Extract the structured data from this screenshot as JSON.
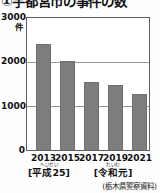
{
  "chart_data": {
    "type": "bar",
    "title": "①宇都宮市の事件の数",
    "xlabel": "",
    "ylabel": "件",
    "ylim": [
      0,
      3000
    ],
    "grid": true,
    "legend": null,
    "categories": [
      "2013",
      "2015",
      "2017",
      "2019",
      "2021"
    ],
    "values": [
      2400,
      2030,
      1550,
      1470,
      1280
    ],
    "ytick_labels": [
      "3000",
      "2000",
      "1000",
      "0"
    ],
    "ytick_values": [
      3000,
      2000,
      1000,
      0
    ],
    "annotations": [
      {
        "ruby": "へいせい",
        "label": "[平成25]",
        "under": "2013"
      },
      {
        "ruby": "れいわ",
        "label": "[令和元]",
        "under": "2019"
      }
    ],
    "source": "(栃木県警察資料)",
    "colors": {
      "bar": "#7d7d7d",
      "bar_edge": "#6e6e6e",
      "frame": "#5f5f5f",
      "gridline": "#9a9a9a",
      "text": "#111111",
      "background": "#fefefe"
    }
  }
}
